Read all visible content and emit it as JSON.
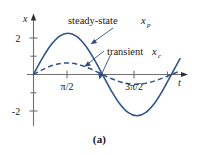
{
  "figure": {
    "caption": "(a)",
    "axis_x_label": "t",
    "axis_y_label": "x",
    "annotations": {
      "steady_state": {
        "text": "steady-state ",
        "symbol": "x",
        "subscript": "p"
      },
      "transient": {
        "text": "transient ",
        "symbol": "x",
        "subscript": "c"
      }
    },
    "x_ticks": [
      {
        "label": "π/2",
        "value": 1.5708
      },
      {
        "label": "",
        "value": 3.1416
      },
      {
        "label": "3π/2",
        "value": 4.7124
      },
      {
        "label": "",
        "value": 6.2832
      }
    ],
    "y_ticks": [
      {
        "label": "2",
        "value": 2
      },
      {
        "label": "",
        "value": 1
      },
      {
        "label": "",
        "value": -1
      },
      {
        "label": "-2",
        "value": -2
      }
    ],
    "colors": {
      "curve": "#31548a",
      "axis": "#6f6f74",
      "text": "#17171a",
      "background": "#ffffff"
    }
  },
  "chart_data": {
    "type": "line",
    "title": "",
    "subtitle": "",
    "xlabel": "t",
    "ylabel": "x",
    "xlim": [
      -0.35,
      7.1
    ],
    "ylim": [
      -2.9,
      2.9
    ],
    "grid": false,
    "legend": "inline-annotations",
    "x_tick_labels": [
      "π/2",
      "3π/2"
    ],
    "y_tick_labels": [
      "2",
      "-2"
    ],
    "annotations": [
      "steady-state x_p",
      "transient x_c"
    ],
    "series": [
      {
        "name": "steady-state x_p",
        "style": "solid",
        "color": "#31548a",
        "formula": "2*sin(t)",
        "x": [
          0,
          0.3927,
          0.7854,
          1.1781,
          1.5708,
          1.9635,
          2.3562,
          2.7489,
          3.1416,
          3.5343,
          3.927,
          4.3197,
          4.7124,
          5.1051,
          5.4978,
          5.8905,
          6.2832,
          6.6759
        ],
        "values": [
          0,
          0.765,
          1.414,
          1.848,
          2.0,
          1.848,
          1.414,
          0.765,
          0,
          -0.765,
          -1.414,
          -1.848,
          -2.0,
          -1.848,
          -1.414,
          -0.765,
          0,
          0.765
        ]
      },
      {
        "name": "transient x_c",
        "style": "dashed",
        "color": "#31548a",
        "formula": "0.62*exp(-0.12*t)*sin(t)",
        "x": [
          0,
          0.3927,
          0.7854,
          1.1781,
          1.5708,
          1.9635,
          2.3562,
          2.7489,
          3.1416,
          3.5343,
          3.927,
          4.3197,
          4.7124,
          5.1051,
          5.4978,
          5.8905,
          6.2832,
          6.6759
        ],
        "values": [
          0,
          0.226,
          0.41,
          0.525,
          0.558,
          0.504,
          0.377,
          0.2,
          0,
          -0.193,
          -0.35,
          -0.448,
          -0.476,
          -0.43,
          -0.322,
          -0.171,
          0,
          0.165
        ]
      }
    ]
  }
}
